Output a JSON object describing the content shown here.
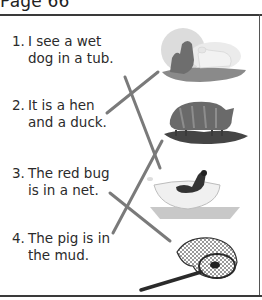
{
  "page": {
    "header_title": "Page 66"
  },
  "sentences": [
    {
      "number": "1.",
      "line1": "I see a wet",
      "line2": "dog in a tub."
    },
    {
      "number": "2.",
      "line1": "It is a hen",
      "line2": "and a duck."
    },
    {
      "number": "3.",
      "line1": "The red bug",
      "line2": "is in a net."
    },
    {
      "number": "4.",
      "line1": "The pig is in",
      "line2": "the mud."
    }
  ],
  "pictures": [
    {
      "name": "hen-and-duck-picture",
      "depicts": "hen and duck"
    },
    {
      "name": "pig-in-mud-picture",
      "depicts": "pig in mud"
    },
    {
      "name": "dog-in-tub-picture",
      "depicts": "wet dog in tub"
    },
    {
      "name": "bug-in-net-picture",
      "depicts": "bug in net"
    }
  ],
  "matching_lines": [
    {
      "from_sentence": "1",
      "to_picture": "dog in tub",
      "x1": 125,
      "y1": 77,
      "x2": 160,
      "y2": 168
    },
    {
      "from_sentence": "2",
      "to_picture": "hen and duck",
      "x1": 107,
      "y1": 113,
      "x2": 158,
      "y2": 72
    },
    {
      "from_sentence": "3",
      "to_picture": "bug in net",
      "x1": 110,
      "y1": 193,
      "x2": 170,
      "y2": 241
    },
    {
      "from_sentence": "4",
      "to_picture": "pig in mud",
      "x1": 113,
      "y1": 233,
      "x2": 162,
      "y2": 141
    }
  ],
  "colors": {
    "line": "#7a7a7a",
    "text": "#2b2b2b",
    "rule": "#3a3a3a"
  }
}
